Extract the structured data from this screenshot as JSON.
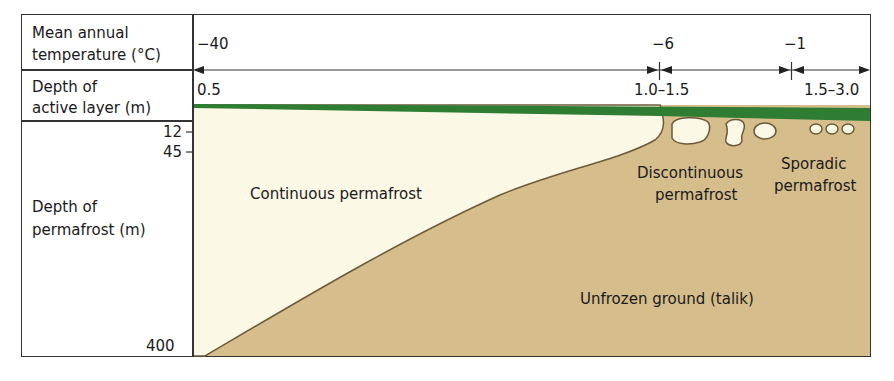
{
  "left_labels": {
    "temperature": [
      "Mean annual",
      "temperature (°C)"
    ],
    "active_layer": [
      "Depth of",
      "active layer (m)"
    ],
    "permafrost_depth": [
      "Depth of",
      "permafrost (m)"
    ]
  },
  "temperatures": [
    {
      "value": "−40"
    },
    {
      "value": "−6"
    },
    {
      "value": "−1"
    }
  ],
  "active_layer_depths": [
    {
      "value": "0.5"
    },
    {
      "value": "1.0–1.5"
    },
    {
      "value": "1.5–3.0"
    }
  ],
  "depth_ticks": [
    {
      "value": "12"
    },
    {
      "value": "45"
    },
    {
      "value": "400"
    }
  ],
  "zones": {
    "continuous": "Continuous permafrost",
    "discontinuous": [
      "Discontinuous",
      "permafrost"
    ],
    "sporadic": [
      "Sporadic",
      "permafrost"
    ],
    "unfrozen": "Unfrozen ground (talik)"
  },
  "colors": {
    "active_layer": "#2e7d32",
    "permafrost": "#fbf8e6",
    "unfrozen": "#d6bd8c",
    "outline": "#333333"
  }
}
